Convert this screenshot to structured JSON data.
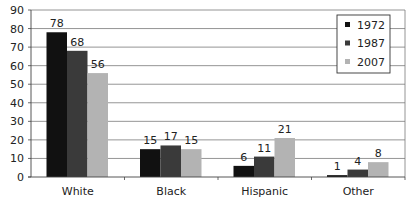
{
  "chart_data": {
    "type": "bar",
    "title": "",
    "xlabel": "",
    "ylabel": "",
    "ylim": [
      0,
      90
    ],
    "yticks": [
      0,
      10,
      20,
      30,
      40,
      50,
      60,
      70,
      80,
      90
    ],
    "grid": true,
    "legend_position": "top-right-inside",
    "categories": [
      "White",
      "Black",
      "Hispanic",
      "Other"
    ],
    "series": [
      {
        "name": "1972",
        "color": "#111111",
        "values": [
          78,
          15,
          6,
          1
        ]
      },
      {
        "name": "1987",
        "color": "#3a3a3a",
        "values": [
          68,
          17,
          11,
          4
        ]
      },
      {
        "name": "2007",
        "color": "#b3b3b3",
        "values": [
          56,
          15,
          21,
          8
        ]
      }
    ]
  }
}
